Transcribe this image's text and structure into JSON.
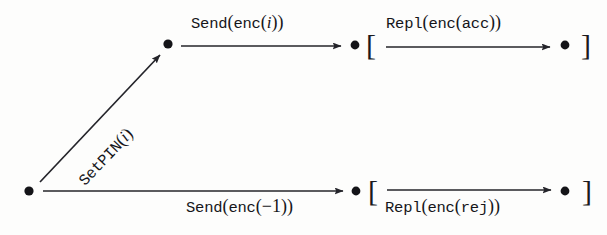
{
  "diagram": {
    "type": "state-transition-diagram",
    "stroke_color": "#24242a",
    "background_color": "#fdfdfc",
    "nodes": [
      {
        "id": "n0",
        "name": "origin-node",
        "x": 29,
        "y": 191
      },
      {
        "id": "n1",
        "name": "pin-set-node",
        "x": 168,
        "y": 44
      },
      {
        "id": "n2",
        "name": "sent-accept-node",
        "x": 355,
        "y": 45
      },
      {
        "id": "n3",
        "name": "replied-accept-node",
        "x": 565,
        "y": 45
      },
      {
        "id": "n4",
        "name": "sent-reject-node",
        "x": 356,
        "y": 191
      },
      {
        "id": "n5",
        "name": "replied-reject-node",
        "x": 565,
        "y": 191
      }
    ],
    "edges": [
      {
        "id": "e0",
        "name": "setpin-edge",
        "from": "n0",
        "to": "n1",
        "label": "SetPIN(i)",
        "label_parts": {
          "mono": "SetPIN",
          "open": "(",
          "italic": "i",
          "close": ")"
        },
        "label_position": "along",
        "rotation_deg": -46.5
      },
      {
        "id": "e1",
        "name": "send-enc-i-edge",
        "from": "n1",
        "to": "n2",
        "label": "Send(enc(i))",
        "label_parts": {
          "mono": "Send",
          "open": "(",
          "mono2": "enc",
          "open2": "(",
          "italic": "i",
          "close2": ")",
          "close": ")"
        },
        "label_position": "above",
        "rotation_deg": 0
      },
      {
        "id": "e2",
        "name": "repl-enc-acc-edge",
        "from": "n2",
        "to": "n3",
        "label": "Repl(enc(acc))",
        "label_parts": {
          "mono": "Repl",
          "open": "(",
          "mono2": "enc",
          "open2": "(",
          "mono3": "acc",
          "close2": ")",
          "close": ")"
        },
        "label_position": "above",
        "rotation_deg": 0,
        "bracket_open": "[",
        "bracket_close": "]"
      },
      {
        "id": "e3",
        "name": "send-enc-minus1-edge",
        "from": "n0",
        "to": "n4",
        "label": "Send(enc(-1))",
        "label_parts": {
          "mono": "Send",
          "open": "(",
          "mono2": "enc",
          "open2": "(",
          "minus": "−",
          "num": "1",
          "close2": ")",
          "close": ")"
        },
        "label_position": "below",
        "rotation_deg": 0
      },
      {
        "id": "e4",
        "name": "repl-enc-rej-edge",
        "from": "n4",
        "to": "n5",
        "label": "Repl(enc(rej))",
        "label_parts": {
          "mono": "Repl",
          "open": "(",
          "mono2": "enc",
          "open2": "(",
          "mono3": "rej",
          "close2": ")",
          "close": ")"
        },
        "label_position": "below",
        "rotation_deg": 0,
        "bracket_open": "[",
        "bracket_close": "]"
      }
    ],
    "brackets": [
      {
        "id": "b0",
        "name": "accept-group-open-bracket",
        "glyph": "[",
        "x": 368,
        "y": 31
      },
      {
        "id": "b1",
        "name": "accept-group-close-bracket",
        "glyph": "]",
        "x": 583,
        "y": 31
      },
      {
        "id": "b2",
        "name": "reject-group-open-bracket",
        "glyph": "[",
        "x": 370,
        "y": 177
      },
      {
        "id": "b3",
        "name": "reject-group-close-bracket",
        "glyph": "]",
        "x": 584,
        "y": 177
      }
    ]
  }
}
